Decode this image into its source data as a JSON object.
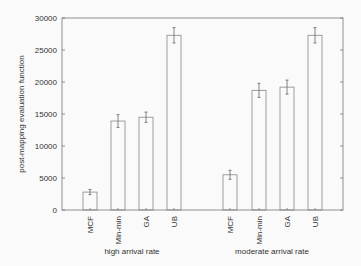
{
  "chart_data": {
    "type": "bar",
    "title": "",
    "xlabel": "",
    "ylabel": "post-mapping evaluation function",
    "ylim": [
      0,
      30000
    ],
    "yticks": [
      0,
      5000,
      10000,
      15000,
      20000,
      25000,
      30000
    ],
    "grid": false,
    "legend": null,
    "groups": [
      {
        "name": "high arrival rate",
        "categories": [
          "MCF",
          "Min-min",
          "GA",
          "UB"
        ],
        "values": [
          2800,
          13900,
          14500,
          27300
        ],
        "errors": [
          400,
          1000,
          800,
          1200
        ]
      },
      {
        "name": "moderate arrival rate",
        "categories": [
          "MCF",
          "Min-min",
          "GA",
          "UB"
        ],
        "values": [
          5500,
          18700,
          19200,
          27300
        ],
        "errors": [
          700,
          1100,
          1100,
          1200
        ]
      }
    ]
  },
  "colors": {
    "bar_stroke": "#888888",
    "axis": "#777777",
    "text": "#333333",
    "background": "#fafafa"
  }
}
